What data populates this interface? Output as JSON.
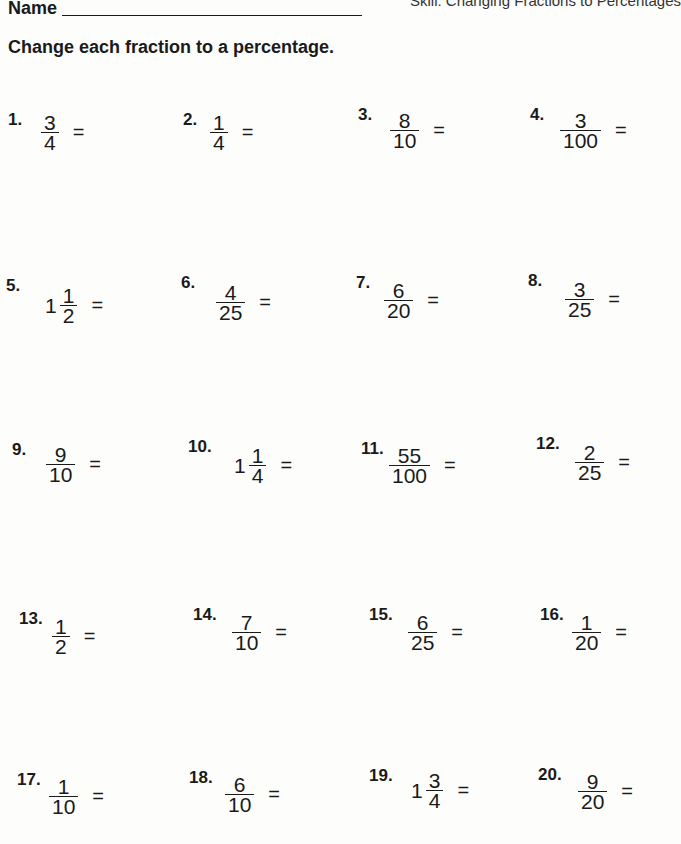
{
  "header": {
    "name_label": "Name",
    "skill": "Skill: Changing Fractions to Percentages"
  },
  "instructions": "Change each fraction to a percentage.",
  "problems": [
    {
      "num": "1.",
      "whole": "",
      "numerator": "3",
      "denominator": "4",
      "eq": "="
    },
    {
      "num": "2.",
      "whole": "",
      "numerator": "1",
      "denominator": "4",
      "eq": "="
    },
    {
      "num": "3.",
      "whole": "",
      "numerator": "8",
      "denominator": "10",
      "eq": "="
    },
    {
      "num": "4.",
      "whole": "",
      "numerator": "3",
      "denominator": "100",
      "eq": "="
    },
    {
      "num": "5.",
      "whole": "1",
      "numerator": "1",
      "denominator": "2",
      "eq": "="
    },
    {
      "num": "6.",
      "whole": "",
      "numerator": "4",
      "denominator": "25",
      "eq": "="
    },
    {
      "num": "7.",
      "whole": "",
      "numerator": "6",
      "denominator": "20",
      "eq": "="
    },
    {
      "num": "8.",
      "whole": "",
      "numerator": "3",
      "denominator": "25",
      "eq": "="
    },
    {
      "num": "9.",
      "whole": "",
      "numerator": "9",
      "denominator": "10",
      "eq": "="
    },
    {
      "num": "10.",
      "whole": "1",
      "numerator": "1",
      "denominator": "4",
      "eq": "="
    },
    {
      "num": "11.",
      "whole": "",
      "numerator": "55",
      "denominator": "100",
      "eq": "="
    },
    {
      "num": "12.",
      "whole": "",
      "numerator": "2",
      "denominator": "25",
      "eq": "="
    },
    {
      "num": "13.",
      "whole": "",
      "numerator": "1",
      "denominator": "2",
      "eq": "="
    },
    {
      "num": "14.",
      "whole": "",
      "numerator": "7",
      "denominator": "10",
      "eq": "="
    },
    {
      "num": "15.",
      "whole": "",
      "numerator": "6",
      "denominator": "25",
      "eq": "="
    },
    {
      "num": "16.",
      "whole": "",
      "numerator": "1",
      "denominator": "20",
      "eq": "="
    },
    {
      "num": "17.",
      "whole": "",
      "numerator": "1",
      "denominator": "10",
      "eq": "="
    },
    {
      "num": "18.",
      "whole": "",
      "numerator": "6",
      "denominator": "10",
      "eq": "="
    },
    {
      "num": "19.",
      "whole": "1",
      "numerator": "3",
      "denominator": "4",
      "eq": "="
    },
    {
      "num": "20.",
      "whole": "",
      "numerator": "9",
      "denominator": "20",
      "eq": "="
    }
  ]
}
